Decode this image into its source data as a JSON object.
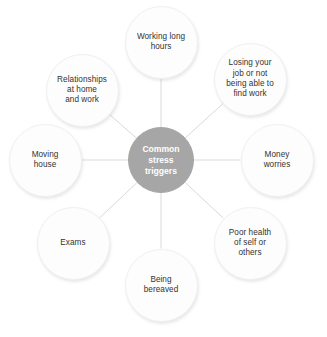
{
  "diagram": {
    "type": "radial-hub-and-spoke",
    "center": {
      "label": "Common\nstress\ntriggers",
      "text": "Common stress triggers",
      "x": 161,
      "y": 160,
      "diameter": 66,
      "fill": "#a6a6a6",
      "text_color": "#ffffff"
    },
    "node_style": {
      "diameter": 73,
      "fill": "#fdfdfd",
      "border": "#f0f0f0",
      "text_color": "#333333"
    },
    "connector_color": "#d9d9d9",
    "nodes": [
      {
        "id": "working-long-hours",
        "label": "Working long\nhours",
        "text": "Working long hours",
        "x": 161,
        "y": 42,
        "angle_deg": 90
      },
      {
        "id": "losing-your-job",
        "label": "Losing your\njob or not\nbeing able to\nfind work",
        "text": "Losing your job or not being able to find work",
        "x": 250,
        "y": 79,
        "angle_deg": 45
      },
      {
        "id": "money-worries",
        "label": "Money\nworries",
        "text": "Money worries",
        "x": 277,
        "y": 160,
        "angle_deg": 0
      },
      {
        "id": "poor-health",
        "label": "Poor health\nof self or\nothers",
        "text": "Poor health of self or others",
        "x": 250,
        "y": 243,
        "angle_deg": -45
      },
      {
        "id": "being-bereaved",
        "label": "Being\nbereaved",
        "text": "Being bereaved",
        "x": 161,
        "y": 285,
        "angle_deg": -90
      },
      {
        "id": "exams",
        "label": "Exams",
        "text": "Exams",
        "x": 73,
        "y": 243,
        "angle_deg": -135
      },
      {
        "id": "moving-house",
        "label": "Moving\nhouse",
        "text": "Moving house",
        "x": 45,
        "y": 160,
        "angle_deg": 180
      },
      {
        "id": "relationships",
        "label": "Relationships\nat home\nand work",
        "text": "Relationships at home and work",
        "x": 82,
        "y": 90,
        "angle_deg": 135
      }
    ]
  }
}
